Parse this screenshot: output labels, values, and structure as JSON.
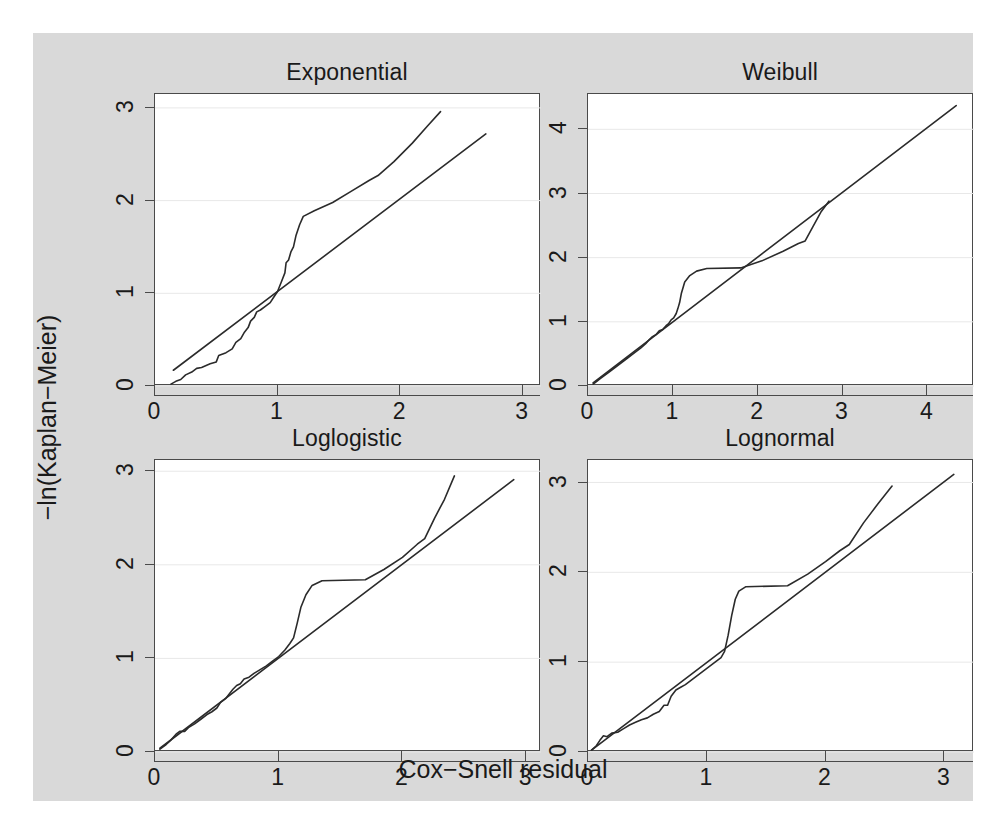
{
  "figure": {
    "background_color": "#d9d9d9",
    "panel_color": "#ffffff",
    "line_color": "#2b2b2b",
    "grid_color": "#e8e8e8",
    "axis_title_x": "Cox−Snell residual",
    "axis_title_y": "−ln(Kaplan−Meier)"
  },
  "chart_data": {
    "type": "line",
    "title": "",
    "xlabel": "Cox−Snell residual",
    "ylabel": "−ln(Kaplan−Meier)",
    "grid": true,
    "legend": "none",
    "layout": "2x2 small multiples",
    "panels": [
      {
        "title": "Exponential",
        "position": "top-left",
        "xlim": [
          0,
          3.15
        ],
        "ylim": [
          0,
          3.15
        ],
        "xticks": [
          0,
          1,
          2,
          3
        ],
        "yticks": [
          0,
          1,
          2,
          3
        ],
        "series": [
          {
            "name": "Nelson-Aalen / -ln(Kaplan-Meier) step curve",
            "style": "step-like polyline",
            "points": [
              [
                0.13,
                0.02
              ],
              [
                0.17,
                0.05
              ],
              [
                0.21,
                0.07
              ],
              [
                0.25,
                0.12
              ],
              [
                0.3,
                0.15
              ],
              [
                0.34,
                0.19
              ],
              [
                0.38,
                0.2
              ],
              [
                0.45,
                0.24
              ],
              [
                0.5,
                0.26
              ],
              [
                0.52,
                0.33
              ],
              [
                0.58,
                0.36
              ],
              [
                0.63,
                0.4
              ],
              [
                0.66,
                0.47
              ],
              [
                0.7,
                0.51
              ],
              [
                0.73,
                0.58
              ],
              [
                0.76,
                0.63
              ],
              [
                0.78,
                0.7
              ],
              [
                0.81,
                0.74
              ],
              [
                0.83,
                0.8
              ],
              [
                0.86,
                0.82
              ],
              [
                0.9,
                0.86
              ],
              [
                0.94,
                0.9
              ],
              [
                0.97,
                0.96
              ],
              [
                1.0,
                1.02
              ],
              [
                1.03,
                1.12
              ],
              [
                1.06,
                1.22
              ],
              [
                1.07,
                1.33
              ],
              [
                1.09,
                1.36
              ],
              [
                1.11,
                1.45
              ],
              [
                1.13,
                1.5
              ],
              [
                1.15,
                1.62
              ],
              [
                1.18,
                1.74
              ],
              [
                1.21,
                1.83
              ],
              [
                1.3,
                1.89
              ],
              [
                1.45,
                1.98
              ],
              [
                1.6,
                2.1
              ],
              [
                1.75,
                2.22
              ],
              [
                1.82,
                2.27
              ],
              [
                1.95,
                2.42
              ],
              [
                2.1,
                2.62
              ],
              [
                2.22,
                2.8
              ],
              [
                2.33,
                2.96
              ]
            ]
          },
          {
            "name": "45-degree reference line",
            "style": "straight line",
            "points": [
              [
                0.15,
                0.17
              ],
              [
                2.7,
                2.72
              ]
            ]
          }
        ]
      },
      {
        "title": "Weibull",
        "position": "top-right",
        "xlim": [
          0,
          4.55
        ],
        "ylim": [
          0,
          4.55
        ],
        "xticks": [
          0,
          1,
          2,
          3,
          4
        ],
        "yticks": [
          0,
          1,
          2,
          3,
          4
        ],
        "series": [
          {
            "name": "Nelson-Aalen / -ln(Kaplan-Meier) step curve",
            "style": "step-like polyline",
            "points": [
              [
                0.06,
                0.03
              ],
              [
                0.1,
                0.07
              ],
              [
                0.14,
                0.11
              ],
              [
                0.2,
                0.17
              ],
              [
                0.26,
                0.23
              ],
              [
                0.33,
                0.3
              ],
              [
                0.4,
                0.37
              ],
              [
                0.47,
                0.44
              ],
              [
                0.55,
                0.52
              ],
              [
                0.62,
                0.59
              ],
              [
                0.68,
                0.66
              ],
              [
                0.72,
                0.72
              ],
              [
                0.76,
                0.77
              ],
              [
                0.8,
                0.8
              ],
              [
                0.84,
                0.86
              ],
              [
                0.88,
                0.88
              ],
              [
                0.92,
                0.94
              ],
              [
                0.95,
                0.97
              ],
              [
                0.98,
                1.03
              ],
              [
                1.01,
                1.06
              ],
              [
                1.04,
                1.13
              ],
              [
                1.06,
                1.21
              ],
              [
                1.08,
                1.3
              ],
              [
                1.1,
                1.44
              ],
              [
                1.14,
                1.62
              ],
              [
                1.2,
                1.72
              ],
              [
                1.28,
                1.79
              ],
              [
                1.4,
                1.83
              ],
              [
                1.8,
                1.84
              ],
              [
                2.05,
                1.95
              ],
              [
                2.3,
                2.1
              ],
              [
                2.48,
                2.22
              ],
              [
                2.56,
                2.26
              ],
              [
                2.65,
                2.48
              ],
              [
                2.75,
                2.72
              ],
              [
                2.84,
                2.88
              ]
            ]
          },
          {
            "name": "45-degree reference line",
            "style": "straight line",
            "points": [
              [
                0.06,
                0.05
              ],
              [
                4.34,
                4.37
              ]
            ]
          }
        ]
      },
      {
        "title": "Loglogistic",
        "position": "bottom-left",
        "xlim": [
          0,
          3.12
        ],
        "ylim": [
          0,
          3.12
        ],
        "xticks": [
          0,
          1,
          2,
          3
        ],
        "yticks": [
          0,
          1,
          2,
          3
        ],
        "series": [
          {
            "name": "Nelson-Aalen / -ln(Kaplan-Meier) step curve",
            "style": "step-like polyline",
            "points": [
              [
                0.04,
                0.03
              ],
              [
                0.09,
                0.08
              ],
              [
                0.13,
                0.13
              ],
              [
                0.17,
                0.19
              ],
              [
                0.2,
                0.22
              ],
              [
                0.24,
                0.22
              ],
              [
                0.27,
                0.26
              ],
              [
                0.32,
                0.3
              ],
              [
                0.37,
                0.35
              ],
              [
                0.42,
                0.4
              ],
              [
                0.46,
                0.43
              ],
              [
                0.5,
                0.47
              ],
              [
                0.53,
                0.53
              ],
              [
                0.57,
                0.57
              ],
              [
                0.6,
                0.62
              ],
              [
                0.63,
                0.67
              ],
              [
                0.66,
                0.71
              ],
              [
                0.69,
                0.73
              ],
              [
                0.72,
                0.78
              ],
              [
                0.76,
                0.8
              ],
              [
                0.8,
                0.84
              ],
              [
                0.85,
                0.88
              ],
              [
                0.9,
                0.92
              ],
              [
                0.95,
                0.97
              ],
              [
                1.0,
                1.02
              ],
              [
                1.05,
                1.09
              ],
              [
                1.09,
                1.16
              ],
              [
                1.12,
                1.22
              ],
              [
                1.15,
                1.38
              ],
              [
                1.18,
                1.55
              ],
              [
                1.22,
                1.68
              ],
              [
                1.27,
                1.78
              ],
              [
                1.35,
                1.83
              ],
              [
                1.7,
                1.84
              ],
              [
                1.85,
                1.95
              ],
              [
                2.0,
                2.08
              ],
              [
                2.12,
                2.22
              ],
              [
                2.18,
                2.28
              ],
              [
                2.26,
                2.5
              ],
              [
                2.34,
                2.7
              ],
              [
                2.42,
                2.95
              ]
            ]
          },
          {
            "name": "45-degree reference line",
            "style": "straight line",
            "points": [
              [
                0.04,
                0.04
              ],
              [
                2.9,
                2.91
              ]
            ]
          }
        ]
      },
      {
        "title": "Lognormal",
        "position": "bottom-right",
        "xlim": [
          0,
          3.25
        ],
        "ylim": [
          0,
          3.25
        ],
        "xticks": [
          0,
          1,
          2,
          3
        ],
        "yticks": [
          0,
          1,
          2,
          3
        ],
        "series": [
          {
            "name": "Nelson-Aalen / -ln(Kaplan-Meier) step curve",
            "style": "step-like polyline",
            "points": [
              [
                0.03,
                0.02
              ],
              [
                0.07,
                0.07
              ],
              [
                0.1,
                0.13
              ],
              [
                0.13,
                0.18
              ],
              [
                0.16,
                0.17
              ],
              [
                0.2,
                0.21
              ],
              [
                0.25,
                0.22
              ],
              [
                0.3,
                0.26
              ],
              [
                0.35,
                0.3
              ],
              [
                0.4,
                0.33
              ],
              [
                0.45,
                0.36
              ],
              [
                0.5,
                0.38
              ],
              [
                0.55,
                0.42
              ],
              [
                0.6,
                0.45
              ],
              [
                0.64,
                0.52
              ],
              [
                0.67,
                0.52
              ],
              [
                0.7,
                0.62
              ],
              [
                0.74,
                0.69
              ],
              [
                0.78,
                0.72
              ],
              [
                0.82,
                0.75
              ],
              [
                0.87,
                0.8
              ],
              [
                0.92,
                0.85
              ],
              [
                0.97,
                0.9
              ],
              [
                1.02,
                0.95
              ],
              [
                1.07,
                1.0
              ],
              [
                1.12,
                1.05
              ],
              [
                1.15,
                1.12
              ],
              [
                1.18,
                1.3
              ],
              [
                1.21,
                1.52
              ],
              [
                1.24,
                1.7
              ],
              [
                1.27,
                1.79
              ],
              [
                1.33,
                1.84
              ],
              [
                1.68,
                1.85
              ],
              [
                1.85,
                1.98
              ],
              [
                2.0,
                2.12
              ],
              [
                2.12,
                2.24
              ],
              [
                2.2,
                2.31
              ],
              [
                2.32,
                2.55
              ],
              [
                2.44,
                2.76
              ],
              [
                2.56,
                2.96
              ]
            ]
          },
          {
            "name": "45-degree reference line",
            "style": "straight line",
            "points": [
              [
                0.03,
                0.02
              ],
              [
                3.08,
                3.09
              ]
            ]
          }
        ]
      }
    ]
  }
}
